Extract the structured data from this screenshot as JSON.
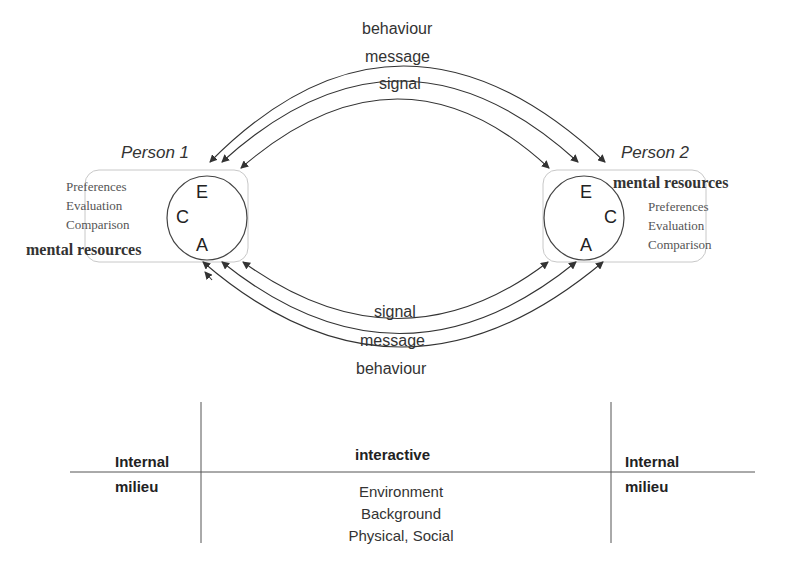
{
  "diagram": {
    "type": "communication-model",
    "colors": {
      "line": "#333333",
      "box": "#c8c8c8",
      "text": "#333333"
    },
    "top_arcs": [
      {
        "label": "behaviour",
        "direction": "bidirectional"
      },
      {
        "label": "message",
        "direction": "bidirectional"
      },
      {
        "label": "signal",
        "direction": "bidirectional"
      }
    ],
    "bottom_arcs": [
      {
        "label": "signal",
        "direction": "bidirectional"
      },
      {
        "label": "message",
        "direction": "bidirectional"
      },
      {
        "label": "behaviour",
        "direction": "bidirectional"
      }
    ],
    "person1": {
      "title": "Person 1",
      "letters": {
        "e": "E",
        "c": "C",
        "a": "A"
      },
      "items": [
        "Preferences",
        "Evaluation",
        "Comparison"
      ],
      "resources_label": "mental resources"
    },
    "person2": {
      "title": "Person 2",
      "letters": {
        "e": "E",
        "c": "C",
        "a": "A"
      },
      "items": [
        "Preferences",
        "Evaluation",
        "Comparison"
      ],
      "resources_label": "mental resources"
    },
    "milieu_table": {
      "left": {
        "top": "Internal",
        "bottom": "milieu"
      },
      "center": {
        "top": "interactive",
        "lines": [
          "Environment",
          "Background",
          "Physical, Social"
        ]
      },
      "right": {
        "top": "Internal",
        "bottom": "milieu"
      }
    }
  }
}
